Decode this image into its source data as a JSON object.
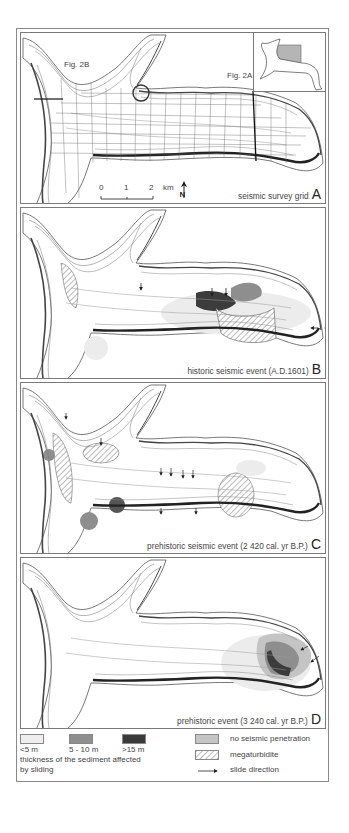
{
  "figure": {
    "panels": [
      {
        "id": "A",
        "caption": "seismic survey grid",
        "letter": "A",
        "labels": {
          "fig2b": "Fig. 2B",
          "fig2a": "Fig. 2A"
        }
      },
      {
        "id": "B",
        "caption": "historic seismic event (A.D.1601)",
        "letter": "B"
      },
      {
        "id": "C",
        "caption": "prehistoric seismic event (2 420 cal. yr B.P.)",
        "letter": "C"
      },
      {
        "id": "D",
        "caption": "prehistoric event (3 240 cal. yr B.P.)",
        "letter": "D"
      }
    ],
    "scale_bar": {
      "ticks": [
        "0",
        "1",
        "2"
      ],
      "unit": "km",
      "north": "N"
    },
    "legend": {
      "thickness_classes": [
        {
          "label": "<5 m",
          "color": "#eeeeee"
        },
        {
          "label": "5 - 10 m",
          "color": "#8e8e8e"
        },
        {
          "label": ">15 m",
          "color": "#3a3a3a"
        }
      ],
      "thickness_caption_line1": "thickness of the sediment affected",
      "thickness_caption_line2": "by sliding",
      "other_items": [
        {
          "label": "no seismic penetration",
          "symbol": "grey-fill",
          "color": "#c4c4c4"
        },
        {
          "label": "megaturbidite",
          "symbol": "hatched"
        },
        {
          "label": "slide direction",
          "symbol": "arrow"
        }
      ]
    }
  }
}
